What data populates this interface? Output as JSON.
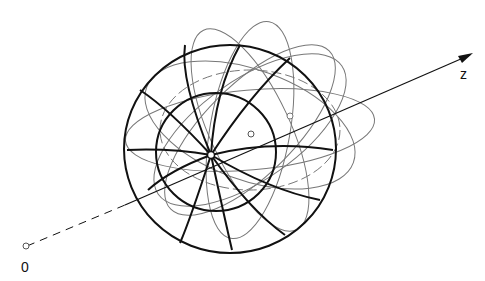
{
  "diagram": {
    "axis_label": "z",
    "origin_label": "0",
    "colors": {
      "stroke": "#111111",
      "light": "#777777",
      "background": "#ffffff"
    }
  }
}
